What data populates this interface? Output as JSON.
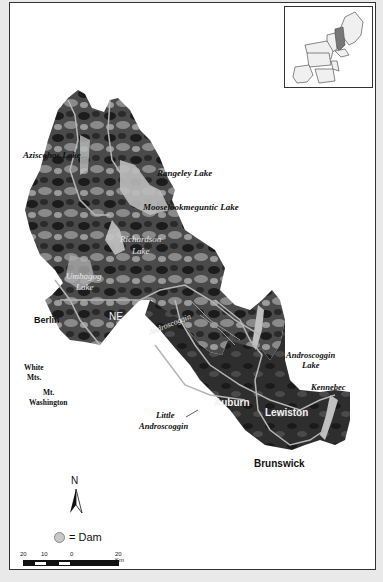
{
  "map": {
    "title": "",
    "labels": {
      "aziscohos_lake": "Aziscohos Lake",
      "rangeley_lake": "Rangeley Lake",
      "mooselookmeguntic_lake": "Mooselookmeguntic Lake",
      "richardson_lake_1": "Richardson",
      "richardson_lake_2": "Lake",
      "umbagog_lake_1": "Umbagog",
      "umbagog_lake_2": "Lake",
      "berlin": "Berlin",
      "ne": "NE",
      "androscoggin_river": "Androscoggin",
      "white_mts_1": "White",
      "white_mts_2": "Mts.",
      "mt_washington_1": "Mt.",
      "mt_washington_2": "Washington",
      "androscoggin_lake_1": "Androscoggin",
      "androscoggin_lake_2": "Lake",
      "kennebec": "Kennebec",
      "little_androscoggin_1": "Little",
      "little_androscoggin_2": "Androscoggin",
      "auburn": "Auburn",
      "lewiston": "Lewiston",
      "brunswick": "Brunswick"
    },
    "inset": {
      "description": "Northeastern United States locator map with study area highlighted"
    },
    "north_arrow": {
      "letter": "N"
    },
    "legend": {
      "dam_label": "= Dam"
    },
    "scale_bar": {
      "ticks": [
        "20",
        "10",
        "0",
        "20 Km"
      ]
    },
    "colors": {
      "background": "#e9e9e9",
      "frame_fill": "#ffffff",
      "frame_border": "#333333",
      "terrain_dark": "#1e1e1e",
      "terrain_mid": "#6e6e6e",
      "water_light": "#bdbdbd",
      "river_line": "#b8b8b8",
      "dam_fill": "#c8c8c8"
    }
  }
}
